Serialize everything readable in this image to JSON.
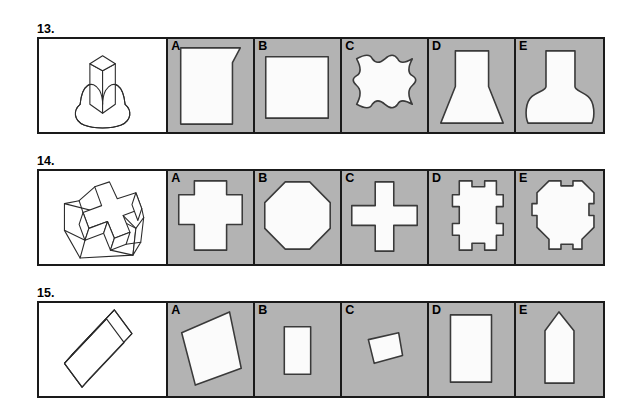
{
  "page": {
    "kind": "spatial-reasoning-worksheet",
    "background_color": "#ffffff",
    "panel_fill_color": "#b3b3b3",
    "shape_fill_color": "#fbfbfb",
    "line_color": "#1a1a1a"
  },
  "questions": [
    {
      "number": "13.",
      "stem": {
        "label": "",
        "description": "rectangular-prism-on-dome-base"
      },
      "options": [
        {
          "letter": "A",
          "description": "square-with-concave-top-notch"
        },
        {
          "letter": "B",
          "description": "plain-square"
        },
        {
          "letter": "C",
          "description": "square-with-wavy-scalloped-edges"
        },
        {
          "letter": "D",
          "description": "flared-trapezoid-funnel"
        },
        {
          "letter": "E",
          "description": "flask-with-rounded-flared-base"
        }
      ]
    },
    {
      "number": "14.",
      "stem": {
        "label": "",
        "description": "three-dimensional-extruded-cross"
      },
      "options": [
        {
          "letter": "A",
          "description": "plus-shape-with-square-body"
        },
        {
          "letter": "B",
          "description": "rounded-octagon-diamond"
        },
        {
          "letter": "C",
          "description": "thin-greek-cross"
        },
        {
          "letter": "D",
          "description": "square-with-notched-tabs"
        },
        {
          "letter": "E",
          "description": "octagon-with-side-tabs"
        }
      ]
    },
    {
      "number": "15.",
      "stem": {
        "label": "",
        "description": "thin-slanted-rectangular-slab"
      },
      "options": [
        {
          "letter": "A",
          "description": "large-tilted-square"
        },
        {
          "letter": "B",
          "description": "small-vertical-rectangle"
        },
        {
          "letter": "C",
          "description": "small-tilted-quadrilateral"
        },
        {
          "letter": "D",
          "description": "tall-vertical-rectangle"
        },
        {
          "letter": "E",
          "description": "pentagon-pointed-top-rectangle"
        }
      ]
    }
  ]
}
